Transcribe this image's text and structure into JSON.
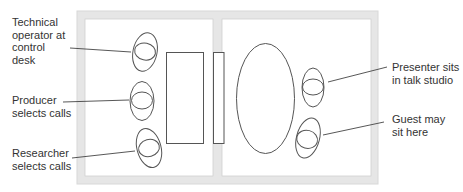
{
  "colors": {
    "wall": "#e6e6e6",
    "wall_edge": "#d4d4d4",
    "line": "#555555",
    "text": "#333333",
    "background": "#ffffff"
  },
  "rooms": [
    {
      "name": "control room",
      "side": "left"
    },
    {
      "name": "talk studio",
      "side": "right"
    }
  ],
  "furniture": {
    "control_desk": "rectangle",
    "studio_window": "narrow rectangle",
    "studio_table": "oval"
  },
  "labels": {
    "technical_operator": "Technical\noperator at\ncontrol\ndesk",
    "producer": "Producer\nselects calls",
    "researcher": "Researcher\nselects calls",
    "presenter": "Presenter sits\nin talk studio",
    "guest": "Guest may\nsit here"
  }
}
